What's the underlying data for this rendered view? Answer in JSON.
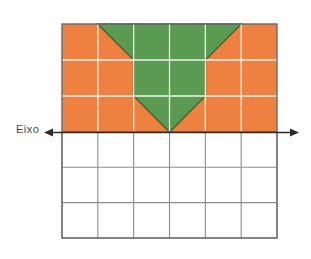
{
  "figure": {
    "label": "Eixo",
    "axis": {
      "orientation": "horizontal",
      "arrow_left": true,
      "arrow_right": true,
      "y_position": 132,
      "x_start": 44,
      "x_end": 299
    },
    "grid": {
      "columns": 6,
      "rows_above_axis": 3,
      "rows_below_axis": 3,
      "left": 62,
      "right": 277,
      "top": 24,
      "bottom": 238,
      "cell_width": 35.83,
      "cell_height": 35.67,
      "gridline_color_colored_area": "#ffffff",
      "gridline_color_white_area": "#8c8c8c",
      "border_color": "#6b6b6b"
    },
    "colors": {
      "orange_fill": "#ee8040",
      "green_fill": "#5a9b52",
      "green_outline": "#3f6b38",
      "axis_color": "#2b2b2b",
      "label_color": "#4a4a4a",
      "background": "#ffffff"
    },
    "shapes": [
      {
        "name": "orange-rectangle",
        "type": "rectangle",
        "fill": "#ee8040",
        "grid_span": "6 columns x 3 rows above axis"
      },
      {
        "name": "green-chevron",
        "type": "polygon",
        "fill": "#5a9b52",
        "description": "downward pointing arrow / chevron spanning columns 2-5 at top, narrowing to a point at the axis at the center column boundary",
        "vertices_grid": [
          [
            2,
            0
          ],
          [
            5,
            0
          ],
          [
            4,
            1
          ],
          [
            4,
            2
          ],
          [
            3,
            3
          ],
          [
            2,
            2
          ],
          [
            2,
            1
          ]
        ]
      }
    ]
  }
}
